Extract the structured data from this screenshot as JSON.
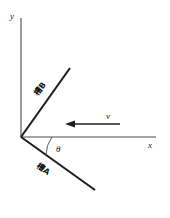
{
  "figure": {
    "background_color": "#ffffff",
    "ink_color": "#1f1f1f",
    "axis_color": "#4a4a4a",
    "width": 170,
    "height": 218
  },
  "axes": {
    "y_label": "y",
    "x_label": "x",
    "origin": {
      "x": 21,
      "y": 137
    }
  },
  "rays": [
    {
      "id": "ray-b",
      "label": "槽B",
      "from": {
        "x": 21,
        "y": 137
      },
      "to": {
        "x": 70,
        "y": 68
      },
      "label_rotation_deg": -54.6
    },
    {
      "id": "ray-a",
      "label": "槽A",
      "from": {
        "x": 21,
        "y": 137
      },
      "to": {
        "x": 95,
        "y": 190
      },
      "label_rotation_deg": 35.6
    }
  ],
  "angle": {
    "symbol": "θ",
    "between": [
      "x-axis",
      "ray-a"
    ]
  },
  "vector": {
    "label": "v",
    "direction": "left",
    "tail": {
      "x": 120,
      "y": 124
    },
    "tip": {
      "x": 66,
      "y": 124
    }
  }
}
